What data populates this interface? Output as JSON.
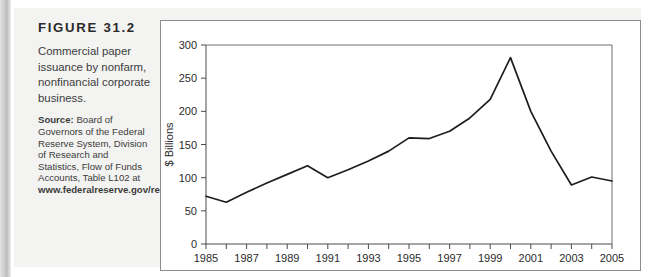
{
  "figure": {
    "title": "FIGURE 31.2",
    "description": "Commercial paper issuance by nonfarm, nonfinancial corporate business.",
    "source_lead": "Source:",
    "source_body": " Board of Governors of the Federal Reserve System, Division of Research and Statistics, Flow of Funds Accounts, Table L102 at ",
    "source_url": "www.federalreserve.gov/releases/z1/current.",
    "panel_background": "#f3f3f1",
    "chart_background": "#ffffff",
    "line_color": "#1d1d1d"
  },
  "chart_data": {
    "type": "line",
    "title": "",
    "xlabel": "",
    "ylabel": "$ Billions",
    "xlim": [
      1985,
      2005
    ],
    "ylim": [
      0,
      300
    ],
    "ytick_step": 50,
    "yticks": [
      0,
      50,
      100,
      150,
      200,
      250,
      300
    ],
    "ytick_labels": [
      "0",
      "50",
      "100",
      "150",
      "200",
      "250",
      "300"
    ],
    "xticks": [
      1985,
      1986,
      1987,
      1988,
      1989,
      1990,
      1991,
      1992,
      1993,
      1994,
      1995,
      1996,
      1997,
      1998,
      1999,
      2000,
      2001,
      2002,
      2003,
      2004,
      2005
    ],
    "xtick_labels_shown": [
      "1985",
      "1987",
      "1989",
      "1991",
      "1993",
      "1995",
      "1997",
      "1999",
      "2001",
      "2003",
      "2005"
    ],
    "xtick_label_step": 2,
    "grid": false,
    "legend": false,
    "x": [
      1985,
      1986,
      1987,
      1988,
      1989,
      1990,
      1991,
      1992,
      1993,
      1994,
      1995,
      1996,
      1997,
      1998,
      1999,
      2000,
      2001,
      2002,
      2003,
      2004,
      2005
    ],
    "values": [
      72,
      63,
      78,
      92,
      105,
      118,
      100,
      112,
      125,
      140,
      160,
      159,
      170,
      190,
      218,
      281,
      200,
      140,
      89,
      101,
      95
    ],
    "series": [
      {
        "name": "Commercial paper issuance",
        "values": [
          72,
          63,
          78,
          92,
          105,
          118,
          100,
          112,
          125,
          140,
          160,
          159,
          170,
          190,
          218,
          281,
          200,
          140,
          89,
          101,
          95
        ]
      }
    ]
  }
}
